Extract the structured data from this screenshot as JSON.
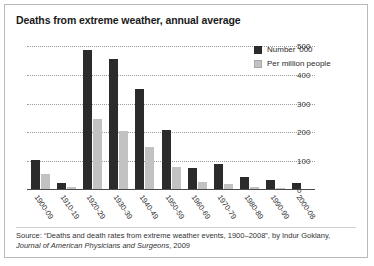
{
  "chart_data": {
    "type": "bar",
    "title": "Deaths from extreme weather, annual average",
    "xlabel": "",
    "ylabel": "",
    "ylim": [
      0,
      500
    ],
    "yticks": [
      0,
      100,
      200,
      300,
      400,
      500
    ],
    "ytick_labels": [
      "0",
      "100",
      "200",
      "300",
      "400",
      "500"
    ],
    "grid": true,
    "legend_position": "top-right",
    "categories": [
      "1900-09",
      "1910-19",
      "1920-29",
      "1930-39",
      "1940-49",
      "1950-59",
      "1960-69",
      "1970-79",
      "1980-89",
      "1990-99",
      "2000-08"
    ],
    "series": [
      {
        "name": "Number '000",
        "color": "#2b2b2b",
        "values": [
          105,
          25,
          485,
          455,
          350,
          210,
          75,
          90,
          45,
          35,
          25
        ]
      },
      {
        "name": "Per million people",
        "color": "#c2c2c2",
        "values": [
          55,
          10,
          245,
          205,
          150,
          80,
          28,
          20,
          10,
          7,
          5
        ]
      }
    ]
  },
  "legend": {
    "items": [
      {
        "label": "Number '000"
      },
      {
        "label": "Per million people"
      }
    ]
  },
  "source": {
    "prefix": "Source: “Deaths and death rates from extreme weather events, 1900–2008”, by Indur Goklany,",
    "journal": "Journal of American Physicians and Surgeons",
    "suffix": ", 2009"
  }
}
